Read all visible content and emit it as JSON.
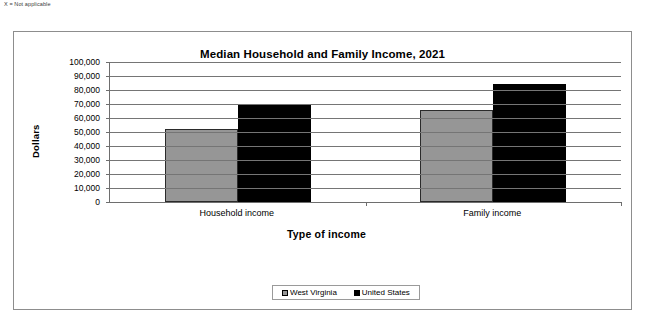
{
  "footnote": "X = Not applicable",
  "chart_data": {
    "type": "bar",
    "title": "Median Household and Family Income, 2021",
    "xlabel": "Type of income",
    "ylabel": "Dollars",
    "categories": [
      "Household income",
      "Family income"
    ],
    "series": [
      {
        "name": "West Virginia",
        "color": "#969696",
        "values": [
          52500,
          66000
        ]
      },
      {
        "name": "United States",
        "color": "#000000",
        "values": [
          69000,
          84000
        ]
      }
    ],
    "ylim": [
      0,
      100000
    ],
    "ytick_labels": [
      "100,000",
      "90,000",
      "80,000",
      "70,000",
      "60,000",
      "50,000",
      "40,000",
      "30,000",
      "20,000",
      "10,000",
      "0"
    ],
    "ytick_values": [
      100000,
      90000,
      80000,
      70000,
      60000,
      50000,
      40000,
      30000,
      20000,
      10000,
      0
    ],
    "grid": true,
    "legend_position": "bottom"
  }
}
